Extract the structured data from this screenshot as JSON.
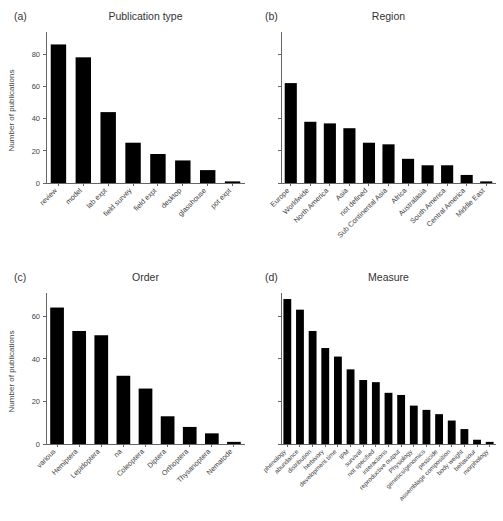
{
  "figure": {
    "ylabel": "Number of publications"
  },
  "panels": [
    {
      "tag": "(a)",
      "title": "Publication type",
      "show_ytick_labels": true,
      "label_size": "normal",
      "chart_data": {
        "type": "bar",
        "title": "Publication type",
        "xlabel": "",
        "ylabel": "Number of publications",
        "ylim": [
          0,
          90
        ],
        "yticks": [
          0,
          20,
          40,
          60,
          80
        ],
        "ytick_labels": [
          "0",
          "20",
          "40",
          "60",
          "80"
        ],
        "grid": false,
        "legend": "none",
        "categories": [
          "review",
          "model",
          "lab expt",
          "field survey",
          "field expt",
          "desktop",
          "glasshouse",
          "pot expt"
        ],
        "values": [
          86,
          78,
          44,
          25,
          18,
          14,
          8,
          1
        ]
      }
    },
    {
      "tag": "(b)",
      "title": "Region",
      "show_ytick_labels": false,
      "label_size": "normal",
      "chart_data": {
        "type": "bar",
        "title": "Region",
        "xlabel": "",
        "ylabel": "",
        "ylim": [
          0,
          90
        ],
        "yticks": [
          0,
          20,
          40,
          60,
          80
        ],
        "ytick_labels": [
          "",
          "",
          "",
          "",
          ""
        ],
        "grid": false,
        "legend": "none",
        "categories": [
          "Europe",
          "Worldwide",
          "North America",
          "Asia",
          "not defined",
          "Sub Continental Asia",
          "Africa",
          "Australasia",
          "South America",
          "Central America",
          "Middle East"
        ],
        "values": [
          62,
          38,
          37,
          34,
          25,
          24,
          15,
          11,
          11,
          5,
          1
        ]
      }
    },
    {
      "tag": "(c)",
      "title": "Order",
      "show_ytick_labels": true,
      "label_size": "normal",
      "chart_data": {
        "type": "bar",
        "title": "Order",
        "xlabel": "",
        "ylabel": "Number of publications",
        "ylim": [
          0,
          68
        ],
        "yticks": [
          0,
          20,
          40,
          60
        ],
        "ytick_labels": [
          "0",
          "20",
          "40",
          "60"
        ],
        "grid": false,
        "legend": "none",
        "categories": [
          "various",
          "Hemiptera",
          "Lepidoptera",
          "na",
          "Coleoptera",
          "Diptera",
          "Orthoptera",
          "Thysanoptera",
          "Nematode"
        ],
        "values": [
          64,
          53,
          51,
          32,
          26,
          13,
          8,
          5,
          1
        ]
      }
    },
    {
      "tag": "(d)",
      "title": "Measure",
      "show_ytick_labels": false,
      "label_size": "small",
      "chart_data": {
        "type": "bar",
        "title": "Measure",
        "xlabel": "",
        "ylabel": "",
        "ylim": [
          0,
          68
        ],
        "yticks": [
          0,
          20,
          40,
          60
        ],
        "ytick_labels": [
          "",
          "",
          "",
          ""
        ],
        "grid": false,
        "legend": "none",
        "categories": [
          "phenology",
          "abundance",
          "distribution",
          "herbivory",
          "development time",
          "IPM",
          "survival",
          "not specified",
          "interactions",
          "reproductive output",
          "Physiology",
          "genetics/genomics",
          "pesticide",
          "assemblage composition",
          "body weight",
          "behaviour",
          "morphology"
        ],
        "values": [
          68,
          63,
          53,
          45,
          41,
          35,
          30,
          29,
          24,
          23,
          18,
          16,
          14,
          11,
          7,
          2,
          1
        ]
      }
    }
  ]
}
